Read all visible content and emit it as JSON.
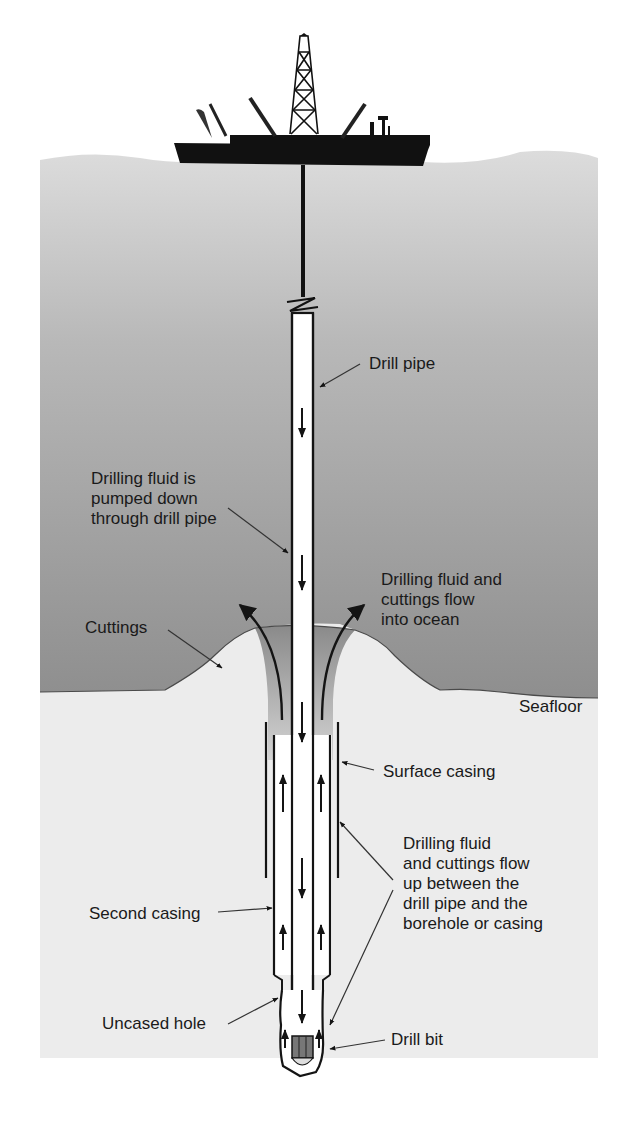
{
  "diagram": {
    "type": "cross-section",
    "colors": {
      "sky": "#ffffff",
      "ocean_top": "#d8d8d8",
      "ocean_bottom": "#8e8e8e",
      "sediment": "#ececec",
      "ship": "#111111",
      "pipe_fill": "#ffffff",
      "outline": "#141414",
      "label_text": "#1a1a1a"
    },
    "labels": {
      "drill_pipe": "Drill pipe",
      "fluid_down": "Drilling fluid is\npumped down\nthrough drill pipe",
      "fluid_out": "Drilling fluid and\ncuttings flow\ninto ocean",
      "cuttings": "Cuttings",
      "seafloor": "Seafloor",
      "surface_casing": "Surface casing",
      "fluid_up": "Drilling fluid\nand cuttings flow\nup between the\ndrill pipe and the\nborehole or casing",
      "second_casing": "Second casing",
      "uncased_hole": "Uncased hole",
      "drill_bit": "Drill bit"
    },
    "components": [
      {
        "id": "drill-ship",
        "name": "Drill ship with derrick"
      },
      {
        "id": "drill-pipe",
        "name": "Drill pipe"
      },
      {
        "id": "cuttings-mound",
        "name": "Cuttings"
      },
      {
        "id": "surface-casing",
        "name": "Surface casing"
      },
      {
        "id": "second-casing",
        "name": "Second casing"
      },
      {
        "id": "uncased-hole",
        "name": "Uncased hole"
      },
      {
        "id": "drill-bit",
        "name": "Drill bit"
      }
    ],
    "flows": [
      {
        "from": "ship",
        "to": "drill bit",
        "via": "drill pipe",
        "direction": "down"
      },
      {
        "from": "drill bit",
        "to": "seafloor",
        "via": "annulus",
        "direction": "up"
      },
      {
        "from": "annulus",
        "to": "ocean",
        "direction": "out"
      }
    ]
  }
}
